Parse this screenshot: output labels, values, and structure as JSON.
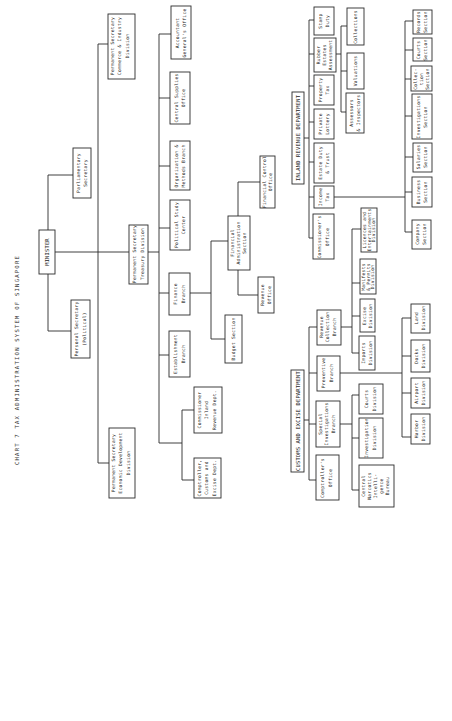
{
  "title": "CHART 7  TAX ADMINISTRATION SYSTEM OF SINGAPORE",
  "orientation": "rotated 90 degrees counter-clockwise",
  "nodes": {
    "minister": "MINISTER",
    "parliamentary_secretary": [
      "Parliamentary",
      "Secretary"
    ],
    "personal_secretary": [
      "Personal Secretary",
      "(Political)"
    ],
    "ps_commerce": [
      "Permanent Secretary",
      "Commerce & Industry",
      "Division"
    ],
    "ps_economic": [
      "Permanent Secretary",
      "Economic Development",
      "Division"
    ],
    "ps_treasury": [
      "Permanent Secretary",
      "Treasury Division"
    ],
    "accountant_general": [
      "Accountant",
      "General's Office"
    ],
    "central_supplies": [
      "Central Supplies",
      "Office"
    ],
    "org_methods": [
      "Organization &",
      "Methods Branch"
    ],
    "political_study": [
      "Political Study",
      "Center"
    ],
    "finance_branch": [
      "Finance",
      "Branch"
    ],
    "establishment_branch": [
      "Establishment",
      "Branch"
    ],
    "commissioner_inland": [
      "Commissioner",
      "Inland",
      "Revenue Dept."
    ],
    "comptroller_customs": [
      "Comptroller,",
      "Customs and",
      "Excise Dept."
    ],
    "financial_admin": [
      "Financial",
      "Administration",
      "Section"
    ],
    "financial_control": [
      "Financial Control",
      "Office"
    ],
    "revenue_office": [
      "Revenue",
      "Office"
    ],
    "budget_section": [
      "Budget Section"
    ]
  },
  "inland_revenue": {
    "header": "INLAND REVENUE DEPARTMENT",
    "branches": {
      "commissioners_office": [
        "Commissioner's",
        "Office"
      ],
      "income_tax": [
        "Income",
        "Tax"
      ],
      "estate_duty": [
        "Estate Duty",
        "& Trust"
      ],
      "private_lottery": [
        "Private",
        "Lottery"
      ],
      "property_tax": [
        "Property",
        "Tax"
      ],
      "rubber_estates": [
        "Rubber",
        "Estates",
        "Assessment"
      ],
      "stamp_duty": [
        "Stamp",
        "Duty"
      ]
    },
    "property_tax_units": {
      "assessors": [
        "Assessors",
        "& Inspectors"
      ],
      "valuations": [
        "Valuations"
      ],
      "collections": [
        "Collections"
      ]
    },
    "income_tax_sections": {
      "company": [
        "Company",
        "Section"
      ],
      "business": [
        "Business",
        "Section"
      ],
      "salaries": [
        "Salaries",
        "Section"
      ],
      "investigations": [
        "Investigations",
        "Section"
      ],
      "collection": [
        "Collec-",
        "tion",
        "Section"
      ],
      "courts": [
        "Courts",
        "Section"
      ],
      "records": [
        "Records",
        "Section"
      ]
    }
  },
  "customs_excise": {
    "header": "CUSTOMS AND EXCISE DEPARTMENT",
    "branches": {
      "comptrollers_office": [
        "Comptroller's",
        "Office"
      ],
      "special_investigations": [
        "Special",
        "Investigations",
        "Branch"
      ],
      "preventive": [
        "Preventive",
        "Branch"
      ],
      "revenue_collection": [
        "Revenue",
        "Collection",
        "Branch"
      ]
    },
    "special_investigations_units": {
      "central_narcotics": [
        "Central",
        "Narcotics",
        "Intelli-",
        "gence",
        "Bureau"
      ],
      "investigation_division": [
        "Investigation",
        "Division"
      ],
      "courts_division": [
        "Courts",
        "Division"
      ]
    },
    "preventive_units": {
      "harbor": [
        "Harbor",
        "Division"
      ],
      "airport": [
        "Airport",
        "Division"
      ],
      "docks": [
        "Docks",
        "Division"
      ],
      "land": [
        "Land",
        "Division"
      ]
    },
    "revenue_collection_units": {
      "imports": [
        "Imports",
        "Division"
      ],
      "excise": [
        "Excise",
        "Division"
      ],
      "manifests": [
        "Manifests",
        "& Permits",
        "Division"
      ],
      "licences": [
        "Licences and",
        "Entertainments",
        "Division"
      ]
    }
  }
}
